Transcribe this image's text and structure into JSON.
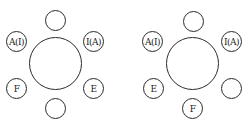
{
  "diagrams": [
    {
      "name": "left-arrangement",
      "seats": {
        "top": "",
        "upper_left": "A(I)",
        "upper_right": "I(A)",
        "lower_left": "F",
        "lower_right": "E",
        "bottom": ""
      }
    },
    {
      "name": "right-arrangement",
      "seats": {
        "top": "",
        "upper_left": "A(I)",
        "upper_right": "I(A)",
        "lower_left": "E",
        "lower_right": "",
        "bottom": "F"
      }
    }
  ]
}
